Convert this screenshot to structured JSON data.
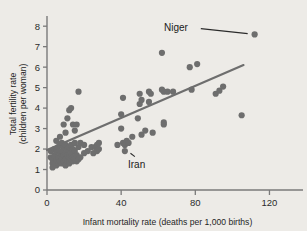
{
  "chart_data": {
    "type": "scatter",
    "title": "",
    "xlabel": "Infant mortality rate (deaths per 1,000 births)",
    "ylabel_line1": "Total fertility rate",
    "ylabel_line2": "(children per woman)",
    "xlim": [
      0,
      130
    ],
    "ylim": [
      0,
      8.4
    ],
    "xticks": [
      0,
      40,
      80,
      120
    ],
    "xtick_labels": [
      "0",
      "40",
      "80",
      "120"
    ],
    "yticks": [
      0,
      1,
      2,
      3,
      4,
      5,
      6,
      7,
      8
    ],
    "ytick_labels": [
      "0",
      "1",
      "2",
      "3",
      "4",
      "5",
      "6",
      "7",
      "8"
    ],
    "grid": false,
    "legend": "none",
    "point_color": "#6e6e6e",
    "line_color": "#6e6e6e",
    "axis_color": "#7a7a7a",
    "background_color": "#edebe7",
    "series": [
      {
        "name": "Countries",
        "points": [
          [
            2,
            1.9
          ],
          [
            2,
            1.6
          ],
          [
            3,
            1.3
          ],
          [
            3,
            1.1
          ],
          [
            3,
            1.5
          ],
          [
            4,
            1.3
          ],
          [
            4,
            1.7
          ],
          [
            4,
            2.0
          ],
          [
            5,
            1.2
          ],
          [
            5,
            1.5
          ],
          [
            5,
            1.9
          ],
          [
            5,
            2.4
          ],
          [
            6,
            1.3
          ],
          [
            6,
            1.6
          ],
          [
            6,
            2.1
          ],
          [
            7,
            1.4
          ],
          [
            7,
            1.8
          ],
          [
            7,
            2.2
          ],
          [
            7,
            2.6
          ],
          [
            8,
            1.3
          ],
          [
            8,
            1.5
          ],
          [
            8,
            1.9
          ],
          [
            8,
            2.3
          ],
          [
            9,
            1.4
          ],
          [
            9,
            1.7
          ],
          [
            9,
            2.1
          ],
          [
            9,
            3.2
          ],
          [
            10,
            1.2
          ],
          [
            10,
            1.5
          ],
          [
            10,
            1.8
          ],
          [
            10,
            2.2
          ],
          [
            10,
            2.8
          ],
          [
            11,
            1.4
          ],
          [
            11,
            1.7
          ],
          [
            11,
            2.0
          ],
          [
            11,
            3.5
          ],
          [
            12,
            1.3
          ],
          [
            12,
            1.6
          ],
          [
            12,
            2.1
          ],
          [
            12,
            3.9
          ],
          [
            13,
            1.5
          ],
          [
            13,
            1.8
          ],
          [
            13,
            2.2
          ],
          [
            13,
            4.0
          ],
          [
            14,
            1.4
          ],
          [
            14,
            1.6
          ],
          [
            14,
            2.0
          ],
          [
            14,
            3.2
          ],
          [
            15,
            1.5
          ],
          [
            15,
            1.9
          ],
          [
            15,
            2.3
          ],
          [
            15,
            2.9
          ],
          [
            16,
            1.4
          ],
          [
            16,
            1.7
          ],
          [
            16,
            3.2
          ],
          [
            17,
            1.5
          ],
          [
            17,
            2.1
          ],
          [
            17,
            4.8
          ],
          [
            18,
            1.6
          ],
          [
            18,
            2.3
          ],
          [
            20,
            1.8
          ],
          [
            20,
            2.2
          ],
          [
            22,
            1.9
          ],
          [
            24,
            2.1
          ],
          [
            25,
            1.8
          ],
          [
            26,
            2.1
          ],
          [
            27,
            1.9
          ],
          [
            27,
            2.2
          ],
          [
            28,
            2.0
          ],
          [
            28,
            2.3
          ],
          [
            38,
            2.2
          ],
          [
            40,
            3.0
          ],
          [
            40,
            3.7
          ],
          [
            41,
            4.5
          ],
          [
            41,
            2.3
          ],
          [
            42,
            1.9
          ],
          [
            42,
            2.2
          ],
          [
            43,
            2.4
          ],
          [
            44,
            2.3
          ],
          [
            46,
            2.6
          ],
          [
            49,
            3.5
          ],
          [
            50,
            4.2
          ],
          [
            50,
            4.7
          ],
          [
            51,
            4.4
          ],
          [
            51,
            2.7
          ],
          [
            53,
            2.9
          ],
          [
            55,
            4.8
          ],
          [
            55,
            4.3
          ],
          [
            56,
            4.7
          ],
          [
            57,
            2.8
          ],
          [
            62,
            6.7
          ],
          [
            62,
            4.9
          ],
          [
            63,
            4.8
          ],
          [
            63,
            3.2
          ],
          [
            63,
            3.3
          ],
          [
            65,
            4.8
          ],
          [
            68,
            4.8
          ],
          [
            77,
            6.0
          ],
          [
            78,
            4.9
          ],
          [
            81,
            6.15
          ],
          [
            91,
            4.7
          ],
          [
            93,
            4.85
          ],
          [
            95,
            5.05
          ],
          [
            105,
            3.65
          ],
          [
            112,
            7.6
          ]
        ]
      }
    ],
    "trend_line": {
      "x_start": 0,
      "y_start": 1.95,
      "x_end": 106,
      "y_end": 6.1
    },
    "annotations": [
      {
        "label": "Niger",
        "point_x": 112,
        "point_y": 7.6,
        "label_x": 76,
        "label_y": 7.95
      },
      {
        "label": "Iran",
        "point_x": 42,
        "point_y": 2.0,
        "label_x": 53,
        "label_y": 1.25
      }
    ]
  }
}
